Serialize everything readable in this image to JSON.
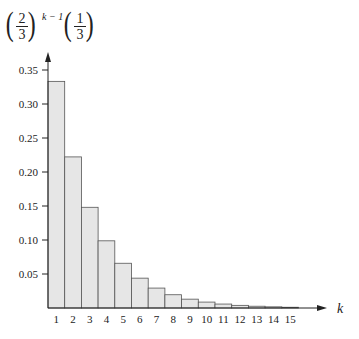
{
  "chart_data": {
    "type": "bar",
    "title_formula": "(2/3)^(k-1) (1/3)",
    "title_parts": {
      "frac1_num": "2",
      "frac1_den": "3",
      "exponent": "k − 1",
      "frac2_num": "1",
      "frac2_den": "3"
    },
    "xlabel": "k",
    "ylabel": "(2/3)^(k−1)(1/3)",
    "categories": [
      "1",
      "2",
      "3",
      "4",
      "5",
      "6",
      "7",
      "8",
      "9",
      "10",
      "11",
      "12",
      "13",
      "14",
      "15"
    ],
    "values": [
      0.3333,
      0.2222,
      0.1481,
      0.0988,
      0.0658,
      0.0439,
      0.0293,
      0.0195,
      0.013,
      0.0087,
      0.0058,
      0.0039,
      0.0026,
      0.0017,
      0.0011
    ],
    "yticks": [
      0.05,
      0.1,
      0.15,
      0.2,
      0.25,
      0.3,
      0.35
    ],
    "ytick_labels": [
      "0.05",
      "0.10",
      "0.15",
      "0.20",
      "0.25",
      "0.30",
      "0.35"
    ],
    "ylim": [
      0,
      0.37
    ],
    "grid": false,
    "legend": null,
    "colors": {
      "bar_fill": "#e6e6e6",
      "bar_stroke": "#555555",
      "axis": "#222222"
    }
  }
}
